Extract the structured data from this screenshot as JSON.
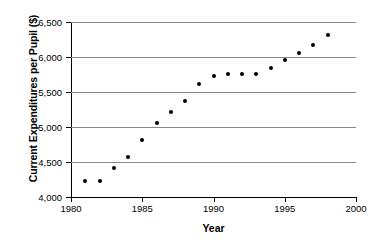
{
  "chart_data": {
    "type": "scatter",
    "title": "",
    "xlabel": "Year",
    "ylabel": "Current Expenditures per Pupil ($)",
    "xlim": [
      1980,
      2000
    ],
    "ylim": [
      4000,
      6500
    ],
    "xticks": [
      1980,
      1985,
      1990,
      1995,
      2000
    ],
    "xtick_labels": [
      "1980",
      "1985",
      "1990",
      "1995",
      "2000"
    ],
    "yticks": [
      4000,
      4500,
      5000,
      5500,
      6000,
      6500
    ],
    "ytick_labels": [
      "4,000",
      "4,500",
      "5,000",
      "5,500",
      "6,000",
      "6,500"
    ],
    "grid": "horizontal",
    "grid_color": "#8a8a8a",
    "axis_color": "#000000",
    "marker_color": "#000000",
    "legend": null,
    "x": [
      1981,
      1982,
      1983,
      1984,
      1985,
      1986,
      1987,
      1988,
      1989,
      1990,
      1991,
      1992,
      1993,
      1994,
      1995,
      1996,
      1997,
      1998
    ],
    "values": [
      4230,
      4235,
      4410,
      4570,
      4810,
      5060,
      5220,
      5370,
      5610,
      5730,
      5760,
      5755,
      5760,
      5850,
      5960,
      6060,
      6170,
      6310
    ]
  }
}
